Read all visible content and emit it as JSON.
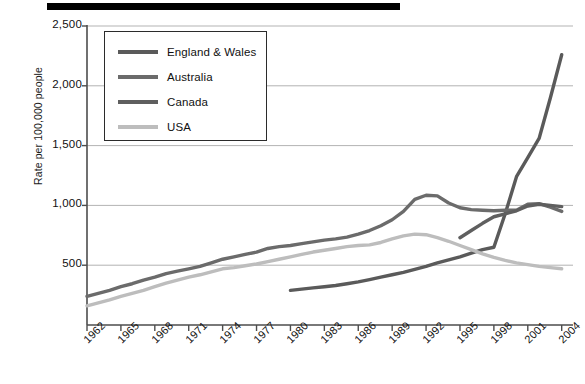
{
  "chart_data": {
    "type": "line",
    "title": "",
    "xlabel": "",
    "ylabel": "Rate per 100,000 people",
    "xlim": [
      1962,
      2005
    ],
    "ylim": [
      0,
      2500
    ],
    "grid": true,
    "legend_position": "upper-left-inside",
    "y_ticks": [
      "500",
      "1,000",
      "1,500",
      "2,000",
      "2,500"
    ],
    "y_tick_values": [
      500,
      1000,
      1500,
      2000,
      2500
    ],
    "x_ticks": [
      "1962",
      "1965",
      "1968",
      "1971",
      "1974",
      "1977",
      "1980",
      "1983",
      "1986",
      "1989",
      "1992",
      "1995",
      "1998",
      "2001",
      "2004"
    ],
    "x_tick_values": [
      1962,
      1965,
      1968,
      1971,
      1974,
      1977,
      1980,
      1983,
      1986,
      1989,
      1992,
      1995,
      1998,
      2001,
      2004
    ],
    "series": [
      {
        "name": "England & Wales",
        "color": "#5a5a5a",
        "x": [
          1980,
          1981,
          1982,
          1983,
          1984,
          1985,
          1986,
          1987,
          1988,
          1989,
          1990,
          1991,
          1992,
          1993,
          1994,
          1995,
          1996,
          1997,
          1998,
          1999,
          2000,
          2001,
          2002,
          2003,
          2004
        ],
        "values": [
          290,
          300,
          310,
          320,
          330,
          345,
          360,
          380,
          400,
          420,
          440,
          465,
          490,
          520,
          545,
          570,
          600,
          630,
          650,
          930,
          1240,
          1400,
          1560,
          1900,
          2260
        ]
      },
      {
        "name": "Australia",
        "color": "#6b6b6b",
        "x": [
          1962,
          1963,
          1964,
          1965,
          1966,
          1967,
          1968,
          1969,
          1970,
          1971,
          1972,
          1973,
          1974,
          1975,
          1976,
          1977,
          1978,
          1979,
          1980,
          1981,
          1982,
          1983,
          1984,
          1985,
          1986,
          1987,
          1988,
          1989,
          1990,
          1991,
          1992,
          1993,
          1994,
          1995,
          1996,
          1997,
          1998,
          1999,
          2000,
          2001,
          2002,
          2003,
          2004
        ],
        "values": [
          240,
          265,
          290,
          320,
          345,
          375,
          400,
          430,
          450,
          470,
          490,
          520,
          550,
          570,
          590,
          610,
          640,
          655,
          665,
          680,
          695,
          710,
          720,
          735,
          760,
          790,
          830,
          880,
          950,
          1050,
          1085,
          1080,
          1020,
          980,
          965,
          960,
          955,
          960,
          960,
          1010,
          1015,
          985,
          950
        ]
      },
      {
        "name": "Canada",
        "color": "#5f5f5f",
        "x": [
          1995,
          1996,
          1997,
          1998,
          1999,
          2000,
          2001,
          2002,
          2003,
          2004
        ],
        "values": [
          730,
          790,
          850,
          905,
          930,
          955,
          995,
          1010,
          1000,
          990
        ]
      },
      {
        "name": "USA",
        "color": "#bdbdbd",
        "x": [
          1962,
          1963,
          1964,
          1965,
          1966,
          1967,
          1968,
          1969,
          1970,
          1971,
          1972,
          1973,
          1974,
          1975,
          1976,
          1977,
          1978,
          1979,
          1980,
          1981,
          1982,
          1983,
          1984,
          1985,
          1986,
          1987,
          1988,
          1989,
          1990,
          1991,
          1992,
          1993,
          1994,
          1995,
          1996,
          1997,
          1998,
          1999,
          2000,
          2001,
          2002,
          2003,
          2004
        ],
        "values": [
          160,
          185,
          210,
          240,
          265,
          290,
          320,
          350,
          375,
          400,
          420,
          445,
          470,
          480,
          495,
          510,
          530,
          550,
          570,
          590,
          610,
          625,
          640,
          655,
          665,
          670,
          690,
          720,
          745,
          760,
          755,
          730,
          700,
          665,
          630,
          595,
          565,
          540,
          520,
          505,
          490,
          480,
          470
        ]
      }
    ]
  },
  "legend": {
    "items": [
      {
        "label": "England & Wales",
        "color": "#5a5a5a"
      },
      {
        "label": "Australia",
        "color": "#6b6b6b"
      },
      {
        "label": "Canada",
        "color": "#5f5f5f"
      },
      {
        "label": "USA",
        "color": "#bdbdbd"
      }
    ]
  },
  "axes": {
    "y_title": "Rate per 100,000 people",
    "axis_color": "#4d4d4d",
    "grid_color": "#b3b3b3"
  }
}
